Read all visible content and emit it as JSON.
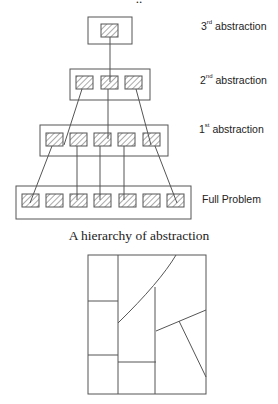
{
  "diagram": {
    "top_text_cut": "..",
    "levels": [
      {
        "ordinal": "3",
        "suffix": "rd",
        "text": " abstraction",
        "cells": 1
      },
      {
        "ordinal": "2",
        "suffix": "nd",
        "text": " abstraction",
        "cells": 3
      },
      {
        "ordinal": "1",
        "suffix": "st",
        "text": " abstraction",
        "cells": 5
      },
      {
        "ordinal": "",
        "suffix": "",
        "text": "Full Problem",
        "cells": 7
      }
    ],
    "caption": "A hierarchy of abstraction",
    "colors": {
      "line": "#555555",
      "hatch": "#555555",
      "background": "#ffffff"
    }
  }
}
